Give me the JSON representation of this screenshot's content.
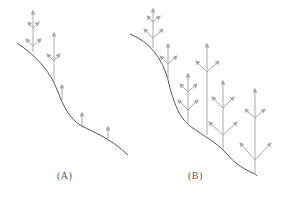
{
  "colors": {
    "background": "#ffffff",
    "stem": "#555555",
    "shoot": "#aaaaaa",
    "label": "#555555"
  },
  "panels": [
    {
      "id": "A",
      "label": "(A)",
      "description": "Single sloped stem (curved line) with a few vertical shoots bearing upward arrows; shoots branch sparsely near top."
    },
    {
      "id": "B",
      "label": "(B)",
      "description": "Sloped stem with many vertical shoots, each repeatedly branching into V-shaped arrowheads forming tree-like structures; shoots grow taller toward the top-left."
    }
  ]
}
